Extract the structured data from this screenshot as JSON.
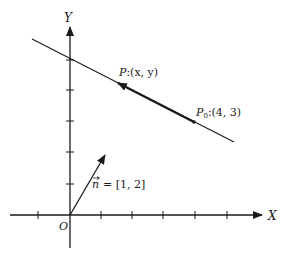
{
  "diagram": {
    "axes": {
      "x_label": "X",
      "y_label": "Y",
      "origin_label": "O",
      "x_ticks": [
        -1,
        1,
        2,
        3,
        4,
        5
      ],
      "y_ticks": [
        1,
        2,
        3,
        4,
        5
      ]
    },
    "line": {
      "equation_hint": "x + 2y = 10"
    },
    "points": {
      "p": {
        "name": "P",
        "coords": ":(x, y)"
      },
      "p0": {
        "name": "P",
        "subscript": "0",
        "coords": ":(4, 3)"
      }
    },
    "normal_vector": {
      "symbol": "n",
      "arrow": "⃗",
      "value": "= [1, 2]"
    },
    "colors": {
      "stroke": "#1a1a1a",
      "background": "#ffffff"
    }
  }
}
